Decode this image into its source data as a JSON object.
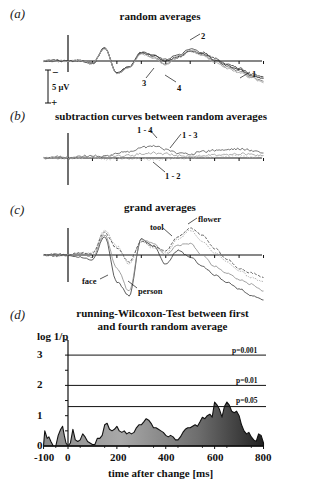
{
  "figure": {
    "panels": [
      {
        "label": "(a)",
        "title": "random averages"
      },
      {
        "label": "(b)",
        "title": "subtraction curves between random averages"
      },
      {
        "label": "(c)",
        "title": "grand averages"
      },
      {
        "label": "(d)",
        "title_line1": "running-Wilcoxon-Test between first",
        "title_line2": "and fourth random average"
      }
    ],
    "scale_bar": {
      "label": "5 µV",
      "minus": "−",
      "plus": "+"
    },
    "xlabel": "time after change [ms]",
    "ylabel": "log 1/p"
  },
  "chart_data": [
    {
      "type": "line",
      "title": "random averages",
      "xlabel": "",
      "ylabel": "µV (negative up)",
      "x": [
        -100,
        -50,
        0,
        50,
        100,
        150,
        200,
        250,
        300,
        350,
        400,
        450,
        500,
        550,
        600,
        650,
        700,
        750,
        800
      ],
      "series": [
        {
          "name": "1",
          "values": [
            0,
            0.3,
            0,
            0.2,
            -1,
            4.5,
            -4,
            -2,
            2.8,
            1.8,
            0,
            1.5,
            3.5,
            2.5,
            0.5,
            -1.5,
            -3,
            -5,
            -6
          ]
        },
        {
          "name": "2",
          "values": [
            0,
            0.2,
            0,
            0.1,
            -0.8,
            4.6,
            -4.2,
            -2,
            3,
            2.2,
            0.5,
            2,
            4,
            3,
            1,
            -1,
            -2.5,
            -4.5,
            -5.5
          ]
        },
        {
          "name": "3",
          "values": [
            0,
            -0.2,
            0,
            0.1,
            -1,
            4.4,
            -4.3,
            -2.1,
            2.6,
            1.5,
            -1,
            1.2,
            3.2,
            2.2,
            0,
            -2,
            -3.5,
            -5.5,
            -7
          ]
        },
        {
          "name": "4",
          "values": [
            0,
            0.1,
            0,
            0.1,
            -0.9,
            4.3,
            -4.5,
            -2.2,
            2.4,
            1,
            -1.5,
            1.8,
            3.8,
            2,
            -0.5,
            -2.5,
            -4,
            -5.8,
            -7.5
          ]
        }
      ],
      "annotations": [
        "1",
        "2",
        "3",
        "4"
      ],
      "scale_bar": "5 µV"
    },
    {
      "type": "line",
      "title": "subtraction curves between random averages",
      "x": [
        -100,
        -50,
        0,
        50,
        100,
        150,
        200,
        250,
        300,
        350,
        400,
        450,
        500,
        550,
        600,
        650,
        700,
        750,
        800
      ],
      "series": [
        {
          "name": "1 - 4",
          "values": [
            0,
            0.3,
            0,
            0.4,
            0.5,
            0.3,
            1.2,
            1.5,
            2.5,
            3,
            2,
            1.2,
            1,
            1.5,
            1.8,
            2,
            2.2,
            1.8,
            1.2
          ]
        },
        {
          "name": "1 - 3",
          "values": [
            0,
            0.2,
            0,
            0.2,
            0.3,
            0.2,
            0.5,
            0.6,
            1,
            1.2,
            1,
            0.6,
            0.5,
            0.6,
            0.8,
            0.9,
            1,
            0.8,
            0.6
          ]
        },
        {
          "name": "1 - 2",
          "values": [
            0,
            -0.2,
            0,
            0.1,
            0,
            -0.3,
            -0.1,
            -0.4,
            -0.2,
            -0.5,
            -0.2,
            0.1,
            -0.1,
            0.2,
            0.3,
            0.4,
            0.5,
            0.3,
            0.2
          ]
        }
      ]
    },
    {
      "type": "line",
      "title": "grand averages",
      "x": [
        -100,
        -50,
        0,
        50,
        100,
        150,
        200,
        250,
        300,
        350,
        400,
        450,
        500,
        550,
        600,
        650,
        700,
        750,
        800
      ],
      "series": [
        {
          "name": "face",
          "values": [
            0,
            0.3,
            0,
            -0.5,
            -1,
            4,
            -6,
            -9,
            3.5,
            2,
            -2,
            1,
            -0.5,
            -2.5,
            -4.5,
            -6,
            -7.5,
            -9,
            -10
          ]
        },
        {
          "name": "person",
          "values": [
            0,
            0.2,
            0,
            0.3,
            -0.5,
            4.5,
            -3,
            -8,
            3.5,
            2.5,
            0,
            2.2,
            2.5,
            0,
            -2.5,
            -4,
            -5.5,
            -6.5,
            -8
          ]
        },
        {
          "name": "tool",
          "values": [
            0,
            -0.3,
            0,
            0.4,
            0.5,
            5.5,
            2,
            -2,
            3,
            1.5,
            0.5,
            3.5,
            5.5,
            3,
            0.5,
            -1.5,
            -3.5,
            -5,
            -6
          ]
        },
        {
          "name": "flower",
          "values": [
            0,
            -0.2,
            0,
            0.5,
            0.3,
            5,
            1.5,
            -1.5,
            3,
            2,
            1,
            4,
            6,
            4.5,
            1.5,
            -1,
            -3,
            -4,
            -5
          ]
        }
      ],
      "annotations": [
        "face",
        "person",
        "tool",
        "flower"
      ]
    },
    {
      "type": "area",
      "title": "running-Wilcoxon-Test between first and fourth random average",
      "xlabel": "time after change [ms]",
      "ylabel": "log 1/p",
      "xlim": [
        -100,
        800
      ],
      "ylim": [
        0,
        3.5
      ],
      "xticks": [
        -100,
        0,
        200,
        400,
        600,
        800
      ],
      "yticks": [
        0,
        1,
        2,
        3
      ],
      "x": [
        -100,
        -95,
        -85,
        -78,
        -70,
        -60,
        -50,
        -40,
        -30,
        -22,
        -15,
        -8,
        0,
        10,
        20,
        30,
        40,
        50,
        60,
        70,
        80,
        90,
        100,
        110,
        120,
        130,
        140,
        150,
        160,
        170,
        180,
        190,
        200,
        210,
        220,
        230,
        240,
        250,
        260,
        270,
        280,
        290,
        300,
        310,
        320,
        330,
        340,
        350,
        360,
        370,
        380,
        390,
        400,
        410,
        420,
        430,
        440,
        450,
        460,
        470,
        480,
        490,
        500,
        510,
        520,
        530,
        540,
        550,
        560,
        570,
        580,
        590,
        600,
        610,
        620,
        630,
        640,
        650,
        660,
        670,
        680,
        690,
        700,
        710,
        720,
        730,
        740,
        750,
        760,
        770,
        780,
        790,
        800
      ],
      "values": [
        0.05,
        0.5,
        0.25,
        0.3,
        0.15,
        0,
        0,
        0.35,
        0.55,
        0.65,
        0.35,
        0.1,
        0,
        0.1,
        0.55,
        0.2,
        0.15,
        0.2,
        0.4,
        0.3,
        0.15,
        0.1,
        0.05,
        0.05,
        0.25,
        0.25,
        0.35,
        0.7,
        0.75,
        0.55,
        0.5,
        0.55,
        0.65,
        0.5,
        0.45,
        0.5,
        0.4,
        0.45,
        0.4,
        0.45,
        0.6,
        0.7,
        0.7,
        0.8,
        0.9,
        0.85,
        0.75,
        0.6,
        0.6,
        0.55,
        0.5,
        0.45,
        0.35,
        0.3,
        0.35,
        0.3,
        0.2,
        0.2,
        0.3,
        0.45,
        0.55,
        0.6,
        0.6,
        0.65,
        0.7,
        0.65,
        0.8,
        0.95,
        0.9,
        1.0,
        1.05,
        0.95,
        1.45,
        1.35,
        1.2,
        0.95,
        1.3,
        1.45,
        1.35,
        1.15,
        1.1,
        1.15,
        1.0,
        0.7,
        0.5,
        0.4,
        0.45,
        0.3,
        0.2,
        0.15,
        0.4,
        0.35,
        0.1
      ],
      "thresholds": [
        {
          "label": "p=0.001",
          "value": 3
        },
        {
          "label": "p=0.01",
          "value": 2
        },
        {
          "label": "p=0.05",
          "value": 1.301
        }
      ]
    }
  ]
}
